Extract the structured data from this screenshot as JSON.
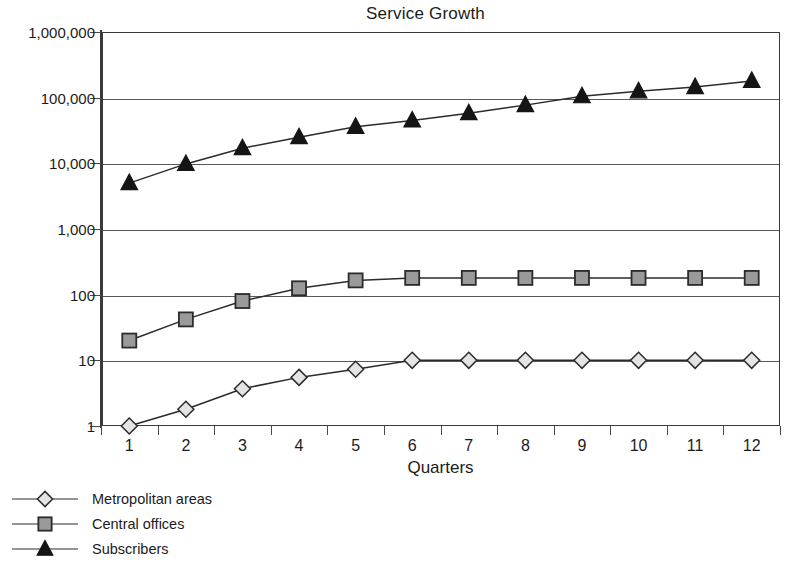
{
  "chart_data": {
    "type": "line",
    "title": "Service Growth",
    "xlabel": "Quarters",
    "ylabel": "",
    "yscale": "log",
    "ylim": [
      1,
      1000000
    ],
    "grid": true,
    "legend_position": "bottom-left",
    "categories": [
      "1",
      "2",
      "3",
      "4",
      "5",
      "6",
      "7",
      "8",
      "9",
      "10",
      "11",
      "12"
    ],
    "ytick_labels": [
      "1",
      "10",
      "100",
      "1,000",
      "10,000",
      "100,000",
      "1,000,000"
    ],
    "ytick_values": [
      1,
      10,
      100,
      1000,
      10000,
      100000,
      1000000
    ],
    "series": [
      {
        "name": "Metropolitan areas",
        "marker": "diamond",
        "marker_fill": "#e4e4e4",
        "marker_stroke": "#2b2b2b",
        "values": [
          1,
          1.8,
          3.7,
          5.5,
          7.3,
          10,
          10,
          10,
          10,
          10,
          10,
          10
        ]
      },
      {
        "name": "Central offices",
        "marker": "square",
        "marker_fill": "#9a9a9a",
        "marker_stroke": "#2b2b2b",
        "values": [
          20,
          42,
          80,
          125,
          165,
          180,
          180,
          180,
          180,
          180,
          180,
          180
        ]
      },
      {
        "name": "Subscribers",
        "marker": "triangle",
        "marker_fill": "#151515",
        "marker_stroke": "#151515",
        "values": [
          5000,
          9800,
          17000,
          25000,
          36000,
          45000,
          58000,
          77000,
          105000,
          125000,
          145000,
          180000
        ]
      }
    ]
  },
  "legend": {
    "items": [
      {
        "label": "Metropolitan areas",
        "marker": "diamond"
      },
      {
        "label": "Central offices",
        "marker": "square"
      },
      {
        "label": "Subscribers",
        "marker": "triangle"
      }
    ]
  },
  "colors": {
    "axis": "#3a3a3a",
    "grid": "#58585a",
    "line": "#2b2b2b",
    "text": "#1b1b1b",
    "background": "#ffffff"
  }
}
